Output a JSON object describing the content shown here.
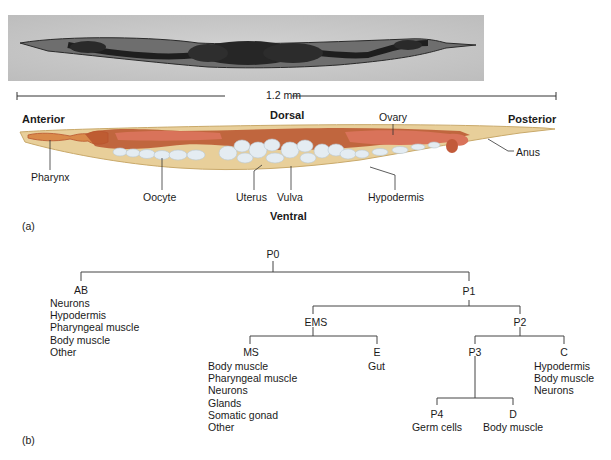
{
  "panel_a": {
    "label": "(a)",
    "scale_bar": "1.2 mm",
    "orientation": {
      "anterior": "Anterior",
      "posterior": "Posterior",
      "dorsal": "Dorsal",
      "ventral": "Ventral"
    },
    "anatomy_labels": {
      "pharynx": "Pharynx",
      "oocyte": "Oocyte",
      "uterus": "Uterus",
      "vulva": "Vulva",
      "hypodermis": "Hypodermis",
      "ovary": "Ovary",
      "anus": "Anus"
    },
    "colors": {
      "body": "#e8cf9a",
      "gut": "#b8542e",
      "gonad": "#d9735a",
      "oocytes": "#e4ecf2"
    }
  },
  "panel_b": {
    "label": "(b)",
    "nodes": {
      "p0": {
        "name": "P0",
        "fates": []
      },
      "ab": {
        "name": "AB",
        "fates": [
          "Neurons",
          "Hypodermis",
          "Pharyngeal muscle",
          "Body muscle",
          "Other"
        ]
      },
      "p1": {
        "name": "P1",
        "fates": []
      },
      "ems": {
        "name": "EMS",
        "fates": []
      },
      "p2": {
        "name": "P2",
        "fates": []
      },
      "ms": {
        "name": "MS",
        "fates": [
          "Body muscle",
          "Pharyngeal muscle",
          "Neurons",
          "Glands",
          "Somatic gonad",
          "Other"
        ]
      },
      "e": {
        "name": "E",
        "fates": [
          "Gut"
        ]
      },
      "p3": {
        "name": "P3",
        "fates": []
      },
      "c": {
        "name": "C",
        "fates": [
          "Hypodermis",
          "Body muscle",
          "Neurons"
        ]
      },
      "p4": {
        "name": "P4",
        "fates": [
          "Germ cells"
        ]
      },
      "d": {
        "name": "D",
        "fates": [
          "Body muscle"
        ]
      }
    }
  }
}
